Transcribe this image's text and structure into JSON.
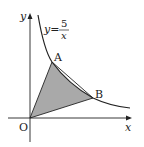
{
  "diagram": {
    "curve_label": {
      "lhs": "y=",
      "numerator": "5",
      "denominator": "x"
    },
    "equation": "y = 5/x",
    "points": {
      "origin": "O",
      "A": "A",
      "B": "B"
    },
    "axes": {
      "x": "x",
      "y": "y"
    },
    "shaded_region": "Region bounded by segments OA, OB and the curve between A and B",
    "colors": {
      "shade": "#a9a9a9",
      "line": "#222222"
    }
  }
}
